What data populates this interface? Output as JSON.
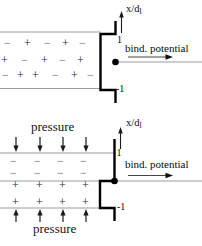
{
  "colors": {
    "background": "#ffffff",
    "thin_line": "#9c9c9c",
    "curve": "#000000",
    "text": "#0a0a0a",
    "plus_symbol": "#2a2a2a",
    "minus_symbol": "#6e6e6e",
    "arrow": "#1a1a1a"
  },
  "top_panel": {
    "vaxis_label": "x/d",
    "vaxis_sub": "l",
    "haxis_label": "bind. potential",
    "tick_upper": "1",
    "tick_lower": "-1",
    "charge_rows": [
      "−+−+−",
      "+−+−+",
      "−++−+−"
    ]
  },
  "bottom_panel": {
    "vaxis_label": "x/d",
    "vaxis_sub": "l",
    "haxis_label": "bind. potential",
    "tick_upper": "1",
    "tick_lower": "-1",
    "pressure_top_label": "pressure",
    "pressure_bottom_label": "pressure",
    "minus_rows": [
      "−−−−",
      "−−−−"
    ],
    "plus_rows": [
      "++++",
      "++++"
    ]
  }
}
